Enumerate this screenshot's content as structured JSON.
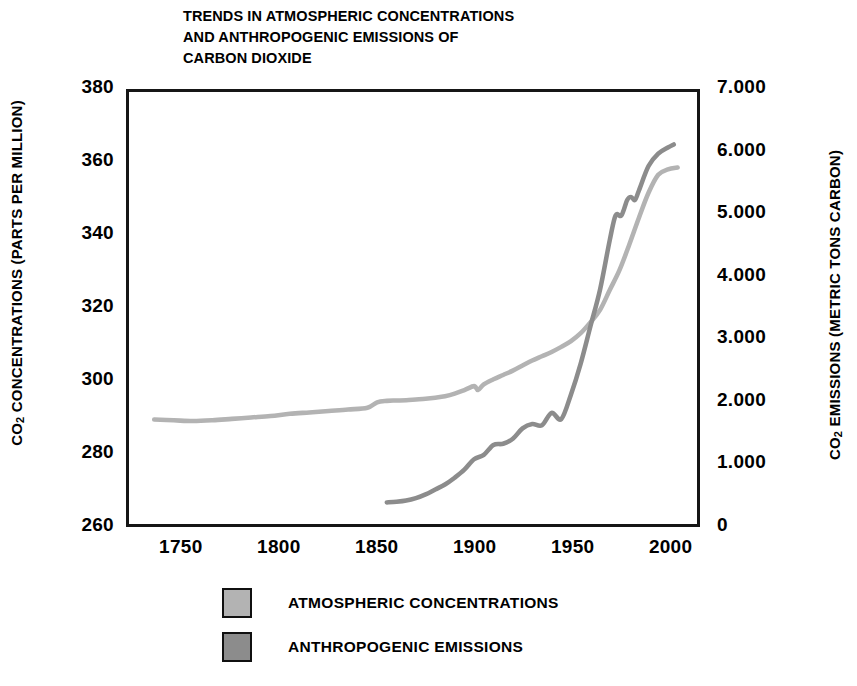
{
  "title": {
    "line1": "TRENDS IN ATMOSPHERIC CONCENTRATIONS",
    "line2": "AND ANTHROPOGENIC EMISSIONS OF",
    "line3": "CARBON DIOXIDE"
  },
  "axes": {
    "y_left_title_pre": "CO",
    "y_left_title_sub": "2",
    "y_left_title_post": " CONCENTRATIONS (PARTS PER MILLION)",
    "y_right_title_pre": "CO",
    "y_right_title_sub": "2",
    "y_right_title_post": " EMISSIONS (METRIC TONS CARBON)",
    "y_left_ticks": [
      "380",
      "360",
      "340",
      "320",
      "300",
      "280",
      "260"
    ],
    "y_right_ticks": [
      "7.000",
      "6.000",
      "5.000",
      "4.000",
      "3.000",
      "2.000",
      "1.000",
      "0"
    ],
    "x_ticks": [
      "1750",
      "1800",
      "1850",
      "1900",
      "1950",
      "2000"
    ]
  },
  "legend": {
    "items": [
      {
        "label": "ATMOSPHERIC CONCENTRATIONS",
        "color": "#b3b3b3"
      },
      {
        "label": "ANTHROPOGENIC EMISSIONS",
        "color": "#8c8c8c"
      }
    ]
  },
  "chart_data": {
    "type": "line",
    "title": "TRENDS IN ATMOSPHERIC CONCENTRATIONS AND ANTHROPOGENIC EMISSIONS OF CARBON DIOXIDE",
    "xlabel": "",
    "xlim": [
      1722,
      2015
    ],
    "grid": false,
    "legend_position": "bottom-left",
    "x_tick_values": [
      1750,
      1800,
      1850,
      1900,
      1950,
      2000
    ],
    "axes_config": [
      {
        "side": "left",
        "label": "CO2 CONCENTRATIONS (PARTS PER MILLION)",
        "ylim": [
          260,
          380
        ],
        "tick_values": [
          260,
          280,
          300,
          320,
          340,
          360,
          380
        ]
      },
      {
        "side": "right",
        "label": "CO2 EMISSIONS (METRIC TONS CARBON)",
        "ylim": [
          0,
          7
        ],
        "tick_values": [
          0,
          1,
          2,
          3,
          4,
          5,
          6,
          7
        ],
        "tick_labels": [
          "0",
          "1.000",
          "2.000",
          "3.000",
          "4.000",
          "5.000",
          "6.000",
          "7.000"
        ]
      }
    ],
    "series": [
      {
        "name": "ATMOSPHERIC CONCENTRATIONS",
        "axis": "left",
        "unit": "parts per million",
        "color": "#b3b3b3",
        "x": [
          1735,
          1745,
          1755,
          1765,
          1775,
          1785,
          1795,
          1805,
          1815,
          1825,
          1835,
          1845,
          1850,
          1855,
          1860,
          1865,
          1870,
          1875,
          1880,
          1885,
          1890,
          1895,
          1900,
          1902,
          1905,
          1910,
          1915,
          1920,
          1925,
          1930,
          1935,
          1940,
          1945,
          1950,
          1955,
          1960,
          1965,
          1970,
          1975,
          1980,
          1985,
          1990,
          1995,
          2000,
          2005
        ],
        "y": [
          289.0,
          288.8,
          288.6,
          288.8,
          289.2,
          289.6,
          290.0,
          290.6,
          291.0,
          291.4,
          291.8,
          292.3,
          293.8,
          294.2,
          294.3,
          294.4,
          294.6,
          294.8,
          295.1,
          295.5,
          296.2,
          297.2,
          298.3,
          297.2,
          298.8,
          300.2,
          301.4,
          302.6,
          304.0,
          305.4,
          306.6,
          307.8,
          309.2,
          310.8,
          313.0,
          316.0,
          319.5,
          325.0,
          330.5,
          337.5,
          345.0,
          352.0,
          357.0,
          358.5,
          359.0
        ]
      },
      {
        "name": "ANTHROPOGENIC EMISSIONS",
        "axis": "right",
        "unit": "billion metric tons carbon",
        "color": "#8c8c8c",
        "x": [
          1855,
          1860,
          1865,
          1870,
          1875,
          1880,
          1885,
          1890,
          1895,
          1900,
          1905,
          1910,
          1915,
          1920,
          1925,
          1930,
          1935,
          1940,
          1945,
          1950,
          1955,
          1960,
          1965,
          1970,
          1973,
          1976,
          1979,
          1981,
          1983,
          1985,
          1990,
          1995,
          2000,
          2003
        ],
        "y": [
          0.35,
          0.36,
          0.38,
          0.42,
          0.48,
          0.56,
          0.64,
          0.75,
          0.88,
          1.05,
          1.12,
          1.28,
          1.3,
          1.38,
          1.55,
          1.62,
          1.6,
          1.8,
          1.7,
          2.1,
          2.6,
          3.2,
          3.8,
          4.6,
          5.0,
          5.0,
          5.25,
          5.3,
          5.25,
          5.4,
          5.8,
          6.0,
          6.1,
          6.15
        ]
      }
    ]
  }
}
